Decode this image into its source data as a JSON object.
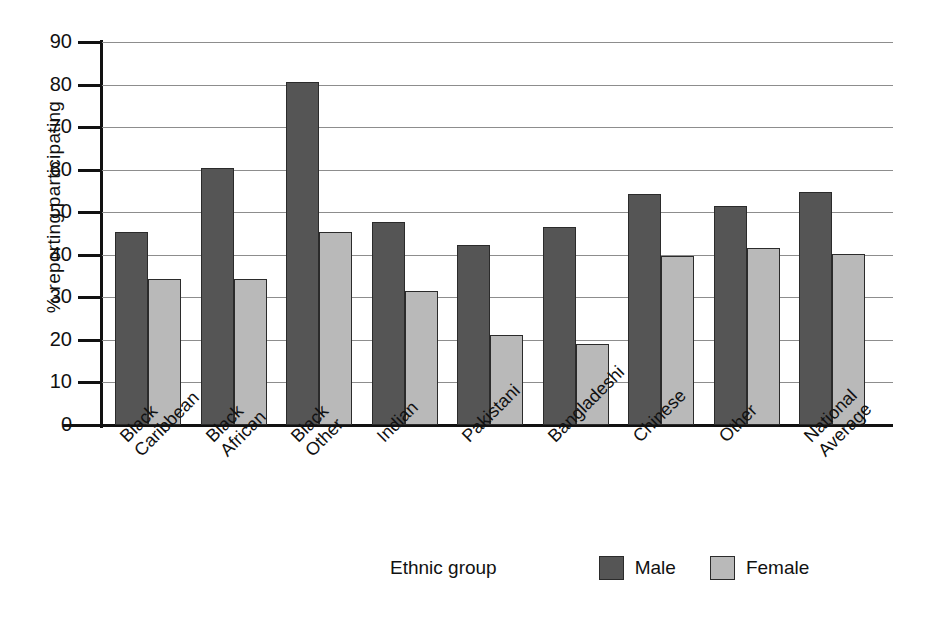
{
  "chart_data": {
    "type": "bar",
    "title": "",
    "xlabel": "Ethnic group",
    "ylabel": "% reporting participating",
    "ylim": [
      0,
      90
    ],
    "ytick_step": 10,
    "yticks": [
      0,
      10,
      20,
      30,
      40,
      50,
      60,
      70,
      80,
      90
    ],
    "grid": true,
    "legend_position": "bottom-right",
    "categories": [
      "Black Caribbean",
      "Black African",
      "Black Other",
      "Indian",
      "Pakistani",
      "Bangladeshi",
      "Chinese",
      "Other",
      "National Average"
    ],
    "category_label_lines": [
      [
        "Black",
        "Caribbean"
      ],
      [
        "Black",
        "African"
      ],
      [
        "Black",
        "Other"
      ],
      [
        "Indian"
      ],
      [
        "Pakistani"
      ],
      [
        "Bangladeshi"
      ],
      [
        "Chinese"
      ],
      [
        "Other"
      ],
      [
        "National",
        "Average"
      ]
    ],
    "series": [
      {
        "name": "Male",
        "color": "#555555",
        "values": [
          45.4,
          60.3,
          80.7,
          47.8,
          42.4,
          46.5,
          54.2,
          51.4,
          54.7
        ]
      },
      {
        "name": "Female",
        "color": "#b9b9b9",
        "values": [
          34.3,
          34.3,
          45.3,
          31.5,
          21.2,
          19.0,
          39.7,
          41.7,
          40.1
        ]
      }
    ]
  },
  "axes": {
    "y_title": "% reporting participating",
    "x_title": "Ethnic group",
    "y_tick_labels": [
      "90",
      "80",
      "70",
      "60",
      "50",
      "40",
      "30",
      "20",
      "10",
      "0"
    ]
  },
  "legend": {
    "items": [
      {
        "label": "Male",
        "color": "#555555"
      },
      {
        "label": "Female",
        "color": "#b9b9b9"
      }
    ]
  }
}
